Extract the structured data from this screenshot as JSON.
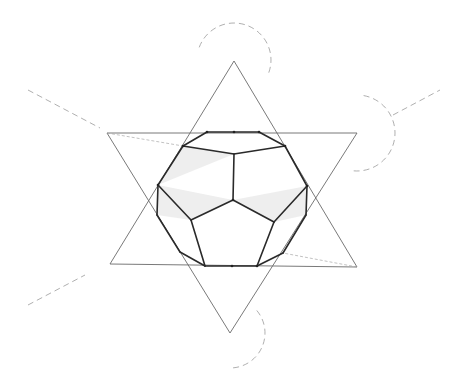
{
  "drawing": {
    "subject": "dodecahedron inscribed in hexagram (pencil sketch)",
    "colors": {
      "background": "#ffffff",
      "ink": "#2a2a2a",
      "guide": "#9a9a9a"
    },
    "hexagram": {
      "up_triangle": [
        [
          234,
          61
        ],
        [
          110,
          264
        ],
        [
          357,
          267
        ]
      ],
      "down_triangle": [
        [
          107,
          133
        ],
        [
          357,
          133
        ],
        [
          230,
          333
        ]
      ]
    },
    "arcs": [
      {
        "cx": 234,
        "cy": 60,
        "r": 37,
        "from_deg": 200,
        "to_deg": 380
      },
      {
        "cx": 357,
        "cy": 133,
        "r": 38,
        "from_deg": -80,
        "to_deg": 95
      },
      {
        "cx": 230,
        "cy": 333,
        "r": 35,
        "from_deg": -40,
        "to_deg": 90
      }
    ],
    "guide_lines": [
      [
        [
          28,
          90
        ],
        [
          100,
          128
        ]
      ],
      [
        [
          393,
          115
        ],
        [
          440,
          90
        ]
      ],
      [
        [
          28,
          305
        ],
        [
          85,
          275
        ]
      ]
    ],
    "dodecahedron": {
      "vertices": {
        "t1": [
          207,
          132
        ],
        "t2": [
          234,
          132
        ],
        "t3": [
          259,
          132
        ],
        "ul": [
          183,
          146
        ],
        "ur": [
          285,
          146
        ],
        "tc": [
          234,
          154
        ],
        "ml": [
          158,
          185
        ],
        "mr": [
          307,
          186
        ],
        "c": [
          233,
          200
        ],
        "ll": [
          157,
          215
        ],
        "lr": [
          306,
          215
        ],
        "pl": [
          191,
          220
        ],
        "pr": [
          274,
          222
        ],
        "bl": [
          180,
          252
        ],
        "br": [
          283,
          253
        ],
        "b1": [
          205,
          266
        ],
        "b2": [
          232,
          266
        ],
        "b3": [
          257,
          266
        ]
      }
    }
  }
}
